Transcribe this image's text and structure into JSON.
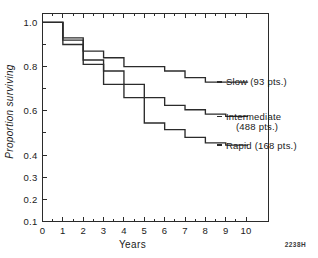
{
  "figure": {
    "corner_code": "2238H"
  },
  "chart_data": {
    "type": "line",
    "subtype": "kaplan-meier-step",
    "title": "",
    "xlabel": "Years",
    "ylabel": "Proportion surviving",
    "xlim": [
      0,
      11.1
    ],
    "ylim": [
      0.1,
      1.04
    ],
    "grid": false,
    "legend_position": "right-inline",
    "x_ticks": [
      0,
      1,
      2,
      3,
      4,
      5,
      6,
      7,
      8,
      9,
      10
    ],
    "x_tick_labels": [
      "0",
      "1",
      "2",
      "3",
      "4",
      "5",
      "6",
      "7",
      "8",
      "9",
      "10"
    ],
    "x_minor_ticks": [
      0.5,
      1.5,
      2.5,
      3.5,
      4.5,
      5.5,
      6.5,
      7.5,
      8.5,
      9.5
    ],
    "y_ticks": [
      0.1,
      0.2,
      0.3,
      0.4,
      0.5,
      0.6,
      0.7,
      0.8,
      0.9,
      1.0
    ],
    "y_tick_labels": [
      "0.1",
      "0.2",
      "0.3",
      "0.4",
      "",
      "0.6",
      "",
      "0.8",
      "",
      "1.0"
    ],
    "y_labeled_ticks": [
      {
        "value": 1.0,
        "label": "1.0"
      },
      {
        "value": 0.8,
        "label": "0.8"
      },
      {
        "value": 0.6,
        "label": "0.6"
      },
      {
        "value": 0.4,
        "label": "0.4"
      },
      {
        "value": 0.3,
        "label": "0.3"
      },
      {
        "value": 0.2,
        "label": "0.2"
      },
      {
        "value": 0.1,
        "label": "0.1"
      }
    ],
    "series": [
      {
        "name": "Slow",
        "label": "Slow (93 pts.)",
        "label_line1": "Slow (93 pts.)",
        "label_line2": "",
        "patients": 93,
        "color": "#2b2b2b",
        "end_value": 0.73,
        "steps": [
          {
            "x": 0.0,
            "y": 1.0
          },
          {
            "x": 1.0,
            "y": 1.0
          },
          {
            "x": 1.0,
            "y": 0.93
          },
          {
            "x": 2.0,
            "y": 0.93
          },
          {
            "x": 2.0,
            "y": 0.87
          },
          {
            "x": 3.0,
            "y": 0.87
          },
          {
            "x": 3.0,
            "y": 0.84
          },
          {
            "x": 4.0,
            "y": 0.84
          },
          {
            "x": 4.0,
            "y": 0.8
          },
          {
            "x": 6.0,
            "y": 0.8
          },
          {
            "x": 6.0,
            "y": 0.78
          },
          {
            "x": 7.0,
            "y": 0.78
          },
          {
            "x": 7.0,
            "y": 0.75
          },
          {
            "x": 8.0,
            "y": 0.75
          },
          {
            "x": 8.0,
            "y": 0.73
          },
          {
            "x": 10.1,
            "y": 0.73
          }
        ]
      },
      {
        "name": "Intermediate",
        "label": "Intermediate (488 pts.)",
        "label_line1": "Intermediate",
        "label_line2": "(488 pts.)",
        "patients": 488,
        "color": "#2b2b2b",
        "end_value": 0.575,
        "steps": [
          {
            "x": 0.0,
            "y": 1.0
          },
          {
            "x": 1.0,
            "y": 1.0
          },
          {
            "x": 1.0,
            "y": 0.92
          },
          {
            "x": 2.0,
            "y": 0.92
          },
          {
            "x": 2.0,
            "y": 0.83
          },
          {
            "x": 3.0,
            "y": 0.83
          },
          {
            "x": 3.0,
            "y": 0.78
          },
          {
            "x": 4.0,
            "y": 0.78
          },
          {
            "x": 4.0,
            "y": 0.72
          },
          {
            "x": 5.0,
            "y": 0.72
          },
          {
            "x": 5.0,
            "y": 0.66
          },
          {
            "x": 6.0,
            "y": 0.66
          },
          {
            "x": 6.0,
            "y": 0.625
          },
          {
            "x": 7.0,
            "y": 0.625
          },
          {
            "x": 7.0,
            "y": 0.605
          },
          {
            "x": 8.0,
            "y": 0.605
          },
          {
            "x": 8.0,
            "y": 0.585
          },
          {
            "x": 9.0,
            "y": 0.585
          },
          {
            "x": 9.0,
            "y": 0.575
          },
          {
            "x": 10.1,
            "y": 0.575
          }
        ]
      },
      {
        "name": "Rapid",
        "label": "Rapid (168 pts.)",
        "label_line1": "Rapid (168 pts.)",
        "label_line2": "",
        "patients": 168,
        "color": "#2b2b2b",
        "end_value": 0.445,
        "steps": [
          {
            "x": 0.0,
            "y": 1.0
          },
          {
            "x": 1.0,
            "y": 1.0
          },
          {
            "x": 1.0,
            "y": 0.9
          },
          {
            "x": 2.0,
            "y": 0.9
          },
          {
            "x": 2.0,
            "y": 0.81
          },
          {
            "x": 3.0,
            "y": 0.81
          },
          {
            "x": 3.0,
            "y": 0.72
          },
          {
            "x": 4.0,
            "y": 0.72
          },
          {
            "x": 4.0,
            "y": 0.66
          },
          {
            "x": 5.0,
            "y": 0.66
          },
          {
            "x": 5.0,
            "y": 0.545
          },
          {
            "x": 6.0,
            "y": 0.545
          },
          {
            "x": 6.0,
            "y": 0.515
          },
          {
            "x": 7.0,
            "y": 0.515
          },
          {
            "x": 7.0,
            "y": 0.48
          },
          {
            "x": 8.0,
            "y": 0.48
          },
          {
            "x": 8.0,
            "y": 0.455
          },
          {
            "x": 9.0,
            "y": 0.455
          },
          {
            "x": 9.0,
            "y": 0.445
          },
          {
            "x": 10.1,
            "y": 0.445
          }
        ]
      }
    ]
  }
}
